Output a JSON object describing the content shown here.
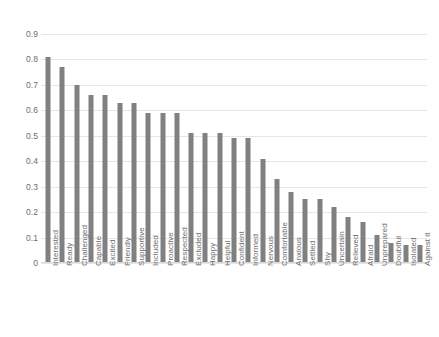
{
  "chart_data": {
    "type": "bar",
    "title": "",
    "subtitle": "",
    "xlabel": "",
    "ylabel": "",
    "ylim": [
      0,
      0.9
    ],
    "grid": true,
    "legend": false,
    "legend_position": "none",
    "orientation": "vertical",
    "bar_color": "#808080",
    "gridline_color": "#e4e7ea",
    "y_ticks": [
      "0",
      "0.1",
      "0.2",
      "0.3",
      "0.4",
      "0.5",
      "0.6",
      "0.7",
      "0.8",
      "0.9"
    ],
    "y_tick_values": [
      0,
      0.1,
      0.2,
      0.3,
      0.4,
      0.5,
      0.6,
      0.7,
      0.8,
      0.9
    ],
    "categories": [
      "Interested",
      "Ready",
      "Challenged",
      "Capable",
      "Excited",
      "Friendly",
      "Supportive",
      "Included",
      "Proactive",
      "Respected",
      "Excluded",
      "Happy",
      "Helpful",
      "Confident",
      "Informed",
      "Nervous",
      "Comfortable",
      "Anxious",
      "Settled",
      "Shy",
      "Uncertain",
      "Relieved",
      "Afraid",
      "Unprepared",
      "Doubtful",
      "Isolated",
      "Against it"
    ],
    "values": [
      0.81,
      0.77,
      0.7,
      0.66,
      0.66,
      0.63,
      0.63,
      0.59,
      0.59,
      0.59,
      0.51,
      0.51,
      0.51,
      0.49,
      0.49,
      0.41,
      0.33,
      0.28,
      0.25,
      0.25,
      0.22,
      0.18,
      0.16,
      0.11,
      0.08,
      0.07,
      0.07
    ]
  }
}
